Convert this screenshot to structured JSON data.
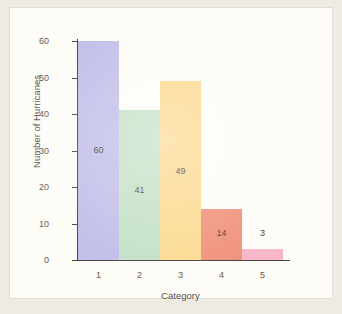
{
  "chart_data": {
    "type": "bar",
    "title": "",
    "subtitle": "",
    "xlabel": "Category",
    "ylabel": "Number of Hurricanes",
    "categories": [
      "1",
      "2",
      "3",
      "4",
      "5"
    ],
    "values": [
      60,
      41,
      49,
      14,
      3
    ],
    "data_labels": [
      "60",
      "41",
      "49",
      "14",
      "3"
    ],
    "series": [
      {
        "name": "Number of Hurricanes",
        "values": [
          60,
          41,
          49,
          14,
          3
        ]
      }
    ],
    "ylim": [
      0,
      60
    ],
    "xlim": [
      0.5,
      5.5
    ],
    "y_ticks": [
      0,
      10,
      20,
      30,
      40,
      50,
      60
    ],
    "y_tick_labels": [
      "0",
      "10",
      "20",
      "30",
      "40",
      "50",
      "60"
    ],
    "x_tick_labels": [
      "1",
      "2",
      "3",
      "4",
      "5"
    ],
    "grid": false,
    "legend": false,
    "legend_position": "none",
    "bar_gap": 0,
    "bar_colors": [
      "#c0bde8",
      "#c3e0c6",
      "#fbd98e",
      "#f0907a",
      "#f7b6c9"
    ],
    "annotations": [
      {
        "text": "3",
        "category": "5",
        "position": "above-bar"
      }
    ]
  },
  "figure": {
    "panel_background": "#fdfcf7",
    "page_background": "#eeebe2",
    "axis_color": "#44403c",
    "tick_label_color": "#5d5a52",
    "axis_title_color": "#55524b",
    "value_label_color": "#3d3a34"
  },
  "bars": [
    {
      "category": "1",
      "value": 60,
      "label": "60",
      "color": "#c0bde8",
      "label_inside": true,
      "label_offset_units": 30
    },
    {
      "category": "2",
      "value": 41,
      "label": "41",
      "color": "#c3e0c6",
      "label_inside": true,
      "label_offset_units": 19
    },
    {
      "category": "3",
      "value": 49,
      "label": "49",
      "color": "#fbd98e",
      "label_inside": true,
      "label_offset_units": 24
    },
    {
      "category": "4",
      "value": 14,
      "label": "14",
      "color": "#f0907a",
      "label_inside": true,
      "label_offset_units": 7
    },
    {
      "category": "5",
      "value": 3,
      "label": "3",
      "color": "#f7b6c9",
      "label_inside": false,
      "label_offset_units": 5
    }
  ],
  "y_axis": {
    "ticks": [
      {
        "value": 60,
        "label": "60"
      },
      {
        "value": 50,
        "label": "50"
      },
      {
        "value": 40,
        "label": "40"
      },
      {
        "value": 30,
        "label": "30"
      },
      {
        "value": 20,
        "label": "20"
      },
      {
        "value": 10,
        "label": "10"
      },
      {
        "value": 0,
        "label": "0"
      }
    ]
  }
}
